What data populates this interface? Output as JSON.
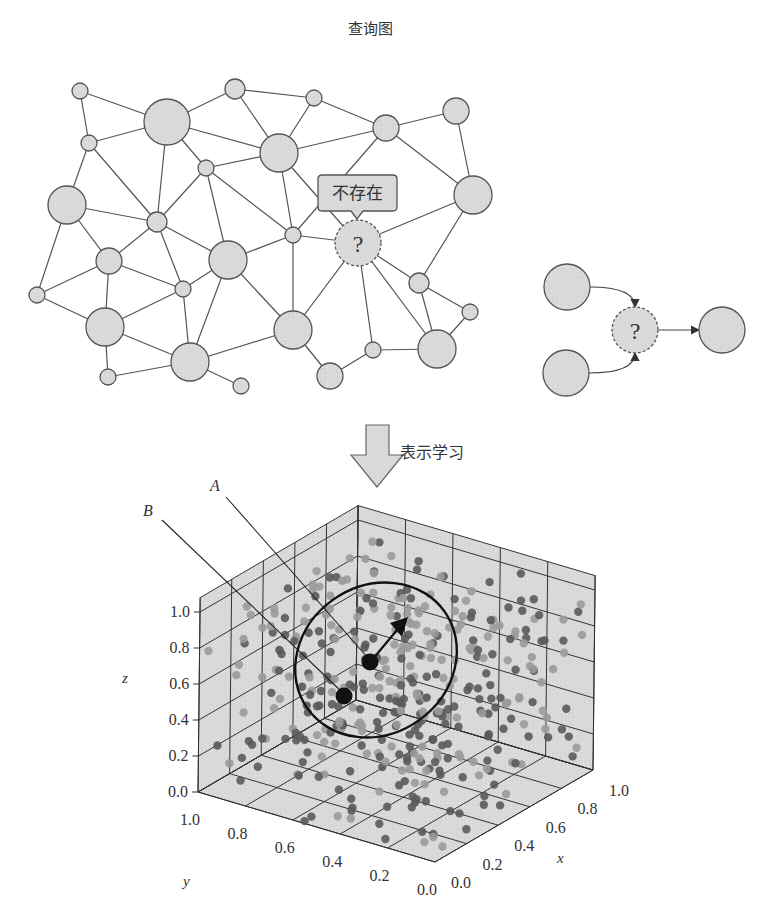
{
  "title": "查询图",
  "tooltip": {
    "label": "不存在",
    "x": 318,
    "y": 175,
    "w": 79,
    "h": 36
  },
  "unknown_symbol": "?",
  "arrow_label": "表示学习",
  "labels": {
    "A": "A",
    "B": "B",
    "x_axis": "x",
    "y_axis": "y",
    "z_axis": "z"
  },
  "colors": {
    "node_fill": "#d9d9d9",
    "node_stroke": "#555555",
    "edge": "#555555",
    "pane": "#d9d9d9",
    "grid": "#333333",
    "point_dark": "#5a5a5a",
    "point_light": "#9a9a9a",
    "highlight": "#111111"
  },
  "graph": {
    "nodes": [
      {
        "id": 1,
        "x": 80,
        "y": 91,
        "r": 8
      },
      {
        "id": 2,
        "x": 167,
        "y": 122,
        "r": 23
      },
      {
        "id": 3,
        "x": 235,
        "y": 89,
        "r": 10
      },
      {
        "id": 4,
        "x": 314,
        "y": 98,
        "r": 8
      },
      {
        "id": 5,
        "x": 386,
        "y": 128,
        "r": 13
      },
      {
        "id": 6,
        "x": 456,
        "y": 111,
        "r": 13
      },
      {
        "id": 7,
        "x": 89,
        "y": 143,
        "r": 8
      },
      {
        "id": 8,
        "x": 279,
        "y": 153,
        "r": 19
      },
      {
        "id": 9,
        "x": 206,
        "y": 168,
        "r": 8
      },
      {
        "id": 10,
        "x": 67,
        "y": 205,
        "r": 19
      },
      {
        "id": 11,
        "x": 473,
        "y": 195,
        "r": 19
      },
      {
        "id": 12,
        "x": 157,
        "y": 222,
        "r": 10
      },
      {
        "id": 13,
        "x": 293,
        "y": 235,
        "r": 8
      },
      {
        "id": 14,
        "x": 358,
        "y": 243,
        "r": 23,
        "unknown": true
      },
      {
        "id": 15,
        "x": 109,
        "y": 261,
        "r": 13
      },
      {
        "id": 16,
        "x": 228,
        "y": 260,
        "r": 19
      },
      {
        "id": 17,
        "x": 419,
        "y": 283,
        "r": 10
      },
      {
        "id": 18,
        "x": 37,
        "y": 295,
        "r": 8
      },
      {
        "id": 19,
        "x": 183,
        "y": 289,
        "r": 8
      },
      {
        "id": 20,
        "x": 470,
        "y": 312,
        "r": 8
      },
      {
        "id": 21,
        "x": 105,
        "y": 327,
        "r": 19
      },
      {
        "id": 22,
        "x": 293,
        "y": 330,
        "r": 19
      },
      {
        "id": 23,
        "x": 437,
        "y": 349,
        "r": 19
      },
      {
        "id": 24,
        "x": 373,
        "y": 350,
        "r": 8
      },
      {
        "id": 25,
        "x": 190,
        "y": 362,
        "r": 19
      },
      {
        "id": 26,
        "x": 108,
        "y": 377,
        "r": 8
      },
      {
        "id": 27,
        "x": 241,
        "y": 386,
        "r": 8
      },
      {
        "id": 28,
        "x": 330,
        "y": 376,
        "r": 13
      }
    ],
    "edges": [
      [
        1,
        2
      ],
      [
        1,
        7
      ],
      [
        2,
        3
      ],
      [
        2,
        7
      ],
      [
        2,
        8
      ],
      [
        2,
        9
      ],
      [
        2,
        12
      ],
      [
        3,
        8
      ],
      [
        3,
        4
      ],
      [
        4,
        8
      ],
      [
        4,
        5
      ],
      [
        5,
        6
      ],
      [
        5,
        8
      ],
      [
        5,
        11
      ],
      [
        5,
        13
      ],
      [
        6,
        11
      ],
      [
        7,
        10
      ],
      [
        7,
        12
      ],
      [
        8,
        9
      ],
      [
        8,
        13
      ],
      [
        8,
        14
      ],
      [
        9,
        12
      ],
      [
        9,
        16
      ],
      [
        9,
        13
      ],
      [
        10,
        12
      ],
      [
        10,
        15
      ],
      [
        10,
        18
      ],
      [
        11,
        14
      ],
      [
        11,
        17
      ],
      [
        12,
        15
      ],
      [
        12,
        16
      ],
      [
        12,
        19
      ],
      [
        13,
        16
      ],
      [
        13,
        22
      ],
      [
        13,
        14
      ],
      [
        14,
        17
      ],
      [
        14,
        22
      ],
      [
        14,
        24
      ],
      [
        14,
        23
      ],
      [
        15,
        18
      ],
      [
        15,
        19
      ],
      [
        15,
        21
      ],
      [
        16,
        19
      ],
      [
        16,
        22
      ],
      [
        16,
        25
      ],
      [
        17,
        20
      ],
      [
        17,
        23
      ],
      [
        18,
        21
      ],
      [
        19,
        21
      ],
      [
        19,
        25
      ],
      [
        20,
        23
      ],
      [
        21,
        25
      ],
      [
        21,
        26
      ],
      [
        22,
        25
      ],
      [
        22,
        28
      ],
      [
        23,
        24
      ],
      [
        24,
        28
      ],
      [
        25,
        26
      ],
      [
        25,
        27
      ]
    ]
  },
  "side_graph": {
    "nodes": [
      {
        "id": "a",
        "x": 567,
        "y": 287,
        "r": 23
      },
      {
        "id": "b",
        "x": 566,
        "y": 373,
        "r": 23
      },
      {
        "id": "q",
        "x": 635,
        "y": 330,
        "r": 23,
        "unknown": true
      },
      {
        "id": "c",
        "x": 722,
        "y": 330,
        "r": 23
      }
    ],
    "edges": [
      [
        "a",
        "q",
        "curve"
      ],
      [
        "b",
        "q",
        "curve"
      ],
      [
        "q",
        "c",
        "straight"
      ]
    ]
  },
  "chart_data": {
    "type": "scatter",
    "subtype": "3d",
    "title": "",
    "xlabel": "x",
    "ylabel": "y",
    "zlabel": "z",
    "x_ticks": [
      "0.0",
      "0.2",
      "0.4",
      "0.6",
      "0.8",
      "1.0"
    ],
    "y_ticks": [
      "1.0",
      "0.8",
      "0.6",
      "0.4",
      "0.2",
      "0.0"
    ],
    "z_ticks": [
      "0.0",
      "0.2",
      "0.4",
      "0.6",
      "0.8",
      "1.0"
    ],
    "xlim": [
      0,
      1
    ],
    "ylim": [
      0,
      1
    ],
    "zlim": [
      0,
      1.1
    ],
    "grid": true,
    "highlighted_points": [
      {
        "label": "A",
        "screen_x": 370,
        "screen_y": 662
      },
      {
        "label": "B",
        "screen_x": 344,
        "screen_y": 696
      }
    ],
    "ellipse": {
      "cx": 376,
      "cy": 660,
      "rx": 84,
      "ry": 74,
      "rotate": -35
    },
    "arrow": {
      "from": [
        372,
        660
      ],
      "to": [
        408,
        617
      ]
    },
    "point_count": 400,
    "point_classes": [
      "dark",
      "light"
    ]
  }
}
